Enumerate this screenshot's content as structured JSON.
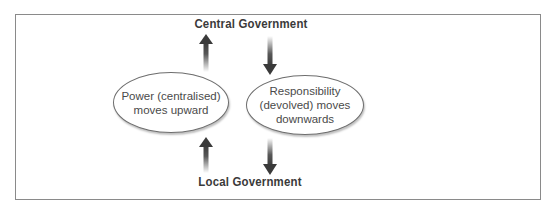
{
  "diagram": {
    "top_label": "Central Government",
    "bottom_label": "Local Government",
    "left_node": {
      "text": "Power (centralised)\nmoves upward",
      "direction": "up"
    },
    "right_node": {
      "text": "Responsibility\n(devolved) moves\ndownwards",
      "direction": "down"
    },
    "arrows": [
      {
        "id": "left-upper",
        "direction": "up",
        "from": "left_node",
        "to": "top_label"
      },
      {
        "id": "left-lower",
        "direction": "up",
        "from": "bottom_label",
        "to": "left_node"
      },
      {
        "id": "right-upper",
        "direction": "down",
        "from": "top_label",
        "to": "right_node"
      },
      {
        "id": "right-lower",
        "direction": "down",
        "from": "right_node",
        "to": "bottom_label"
      }
    ],
    "colors": {
      "arrow": "#3a3a3a",
      "border": "#8a8a8a",
      "text": "#3a3a3a"
    }
  }
}
